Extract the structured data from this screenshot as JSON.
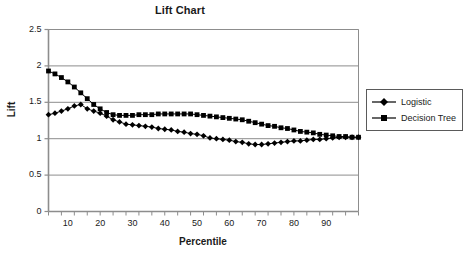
{
  "chart_data": {
    "type": "line",
    "title": "Lift Chart",
    "xlabel": "Percentile",
    "ylabel": "Lift",
    "xlim": [
      4,
      100
    ],
    "ylim": [
      0,
      2.5
    ],
    "grid": "horizontal",
    "legend_position": "right",
    "xticks": [
      "10",
      "20",
      "30",
      "40",
      "50",
      "60",
      "70",
      "80",
      "90"
    ],
    "xtick_values": [
      10,
      20,
      30,
      40,
      50,
      60,
      70,
      80,
      90
    ],
    "yticks": [
      "0",
      "0.5",
      "1",
      "1.5",
      "2",
      "2.5"
    ],
    "ytick_values": [
      0,
      0.5,
      1,
      1.5,
      2,
      2.5
    ],
    "x": [
      4,
      6,
      8,
      10,
      12,
      14,
      16,
      18,
      20,
      22,
      24,
      26,
      28,
      30,
      32,
      34,
      36,
      38,
      40,
      42,
      44,
      46,
      48,
      50,
      52,
      54,
      56,
      58,
      60,
      62,
      64,
      66,
      68,
      70,
      72,
      74,
      76,
      78,
      80,
      82,
      84,
      86,
      88,
      90,
      92,
      94,
      96,
      98,
      100
    ],
    "series": [
      {
        "name": "Logistic",
        "marker": "diamond",
        "color": "#000000",
        "values": [
          1.33,
          1.35,
          1.38,
          1.41,
          1.45,
          1.47,
          1.41,
          1.38,
          1.35,
          1.31,
          1.26,
          1.23,
          1.2,
          1.19,
          1.18,
          1.17,
          1.16,
          1.14,
          1.13,
          1.12,
          1.1,
          1.09,
          1.07,
          1.06,
          1.04,
          1.01,
          1.0,
          0.99,
          0.98,
          0.96,
          0.95,
          0.93,
          0.92,
          0.92,
          0.93,
          0.94,
          0.95,
          0.96,
          0.97,
          0.97,
          0.98,
          0.99,
          0.99,
          1.0,
          1.01,
          1.02,
          1.02,
          1.02,
          1.02
        ]
      },
      {
        "name": "Decision Tree",
        "marker": "square",
        "color": "#000000",
        "values": [
          1.93,
          1.89,
          1.84,
          1.78,
          1.71,
          1.63,
          1.55,
          1.47,
          1.41,
          1.36,
          1.33,
          1.32,
          1.32,
          1.32,
          1.33,
          1.33,
          1.33,
          1.34,
          1.34,
          1.34,
          1.34,
          1.34,
          1.34,
          1.33,
          1.32,
          1.31,
          1.3,
          1.29,
          1.28,
          1.27,
          1.26,
          1.24,
          1.22,
          1.2,
          1.18,
          1.17,
          1.15,
          1.14,
          1.12,
          1.1,
          1.09,
          1.08,
          1.06,
          1.05,
          1.04,
          1.03,
          1.03,
          1.02,
          1.02
        ]
      }
    ]
  },
  "legend": {
    "items": [
      {
        "label": "Logistic"
      },
      {
        "label": "Decision Tree"
      }
    ]
  }
}
